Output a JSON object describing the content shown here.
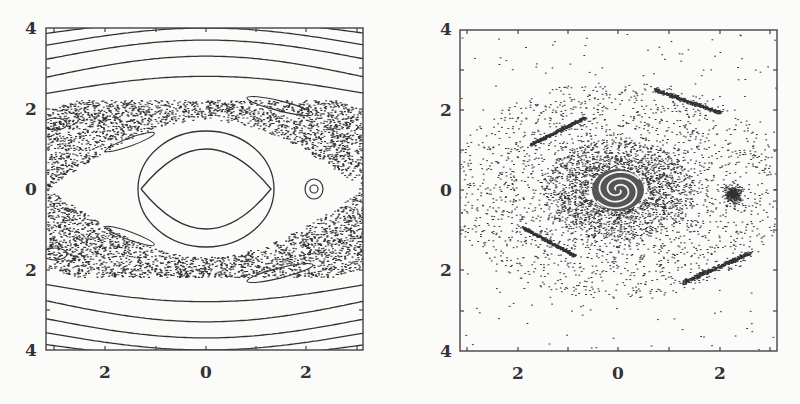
{
  "figure": {
    "panels": [
      {
        "id": "left",
        "description": "Phase portrait: regular KAM curves with a chaotic sea around a central elliptic region",
        "y_tick_labels": [
          "4",
          "2",
          "0",
          "2",
          "4"
        ],
        "x_tick_labels": [
          "2",
          "0",
          "2"
        ]
      },
      {
        "id": "right",
        "description": "Scattered point cloud with a central spiral attractor, a dense island at right, and four elongated clusters",
        "y_tick_labels": [
          "4",
          "2",
          "0",
          "2",
          "4"
        ],
        "x_tick_labels": [
          "2",
          "0",
          "2"
        ]
      }
    ],
    "colors": {
      "ink": "#333333",
      "frame": "#444444",
      "background": "#fbfbfa"
    }
  },
  "chart_data": [
    {
      "type": "scatter",
      "title": "",
      "xlabel": "",
      "ylabel": "",
      "x_ticks": [
        "2",
        "0",
        "2"
      ],
      "y_ticks": [
        "4",
        "2",
        "0",
        "2",
        "4"
      ],
      "xlim": [
        -3.1,
        3.1
      ],
      "ylim": [
        -4,
        4
      ],
      "grid": false,
      "features": [
        "concentric closed orbits around (0,0)",
        "chaotic sea band |y|≈0.8–2.0",
        "island around (2.3,0)",
        "outer wavy invariant curves near y=±2.5, ±3, ±3.5"
      ]
    },
    {
      "type": "scatter",
      "title": "",
      "xlabel": "",
      "ylabel": "",
      "x_ticks": [
        "2",
        "0",
        "2"
      ],
      "y_ticks": [
        "4",
        "2",
        "0",
        "2",
        "4"
      ],
      "xlim": [
        -3.1,
        3.1
      ],
      "ylim": [
        -4,
        4
      ],
      "grid": false,
      "features": [
        "spiral attractor at (0,0)",
        "dense cluster at (2.3,0)",
        "elongated clusters near (-1.3,1.5), (1.5,2.1), (-1.3,-1.3), (2.0,-1.9)",
        "diffuse scattered points"
      ]
    }
  ]
}
